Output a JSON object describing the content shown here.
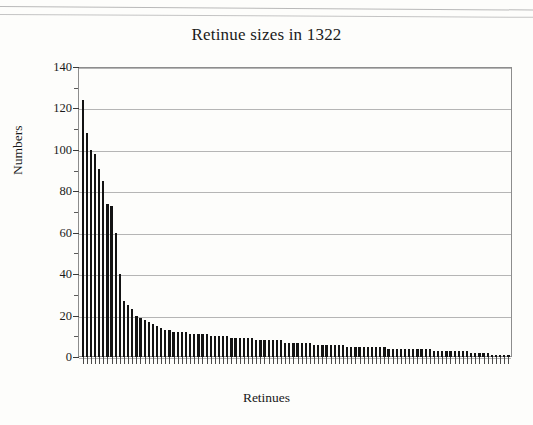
{
  "document": {
    "kind": "scanned-page-figure",
    "artifacts": [
      "scan-rule-top",
      "scan-rule-second"
    ]
  },
  "chart_data": {
    "type": "bar",
    "title": "Retinue sizes in 1322",
    "xlabel": "Retinues",
    "ylabel": "Numbers",
    "ylim": [
      0,
      140
    ],
    "ytick_step": 20,
    "ytick_labels": [
      "0",
      "20",
      "40",
      "60",
      "80",
      "100",
      "120",
      "140"
    ],
    "ytick_values": [
      0,
      20,
      40,
      60,
      80,
      100,
      120,
      140
    ],
    "yminor_step": 10,
    "grid": true,
    "legend": false,
    "xtick_labels": [],
    "bar_color": "#131313",
    "n_bars": 104,
    "categories": [
      "1",
      "2",
      "3",
      "4",
      "5",
      "6",
      "7",
      "8",
      "9",
      "10",
      "11",
      "12",
      "13",
      "14",
      "15",
      "16",
      "17",
      "18",
      "19",
      "20",
      "21",
      "22",
      "23",
      "24",
      "25",
      "26",
      "27",
      "28",
      "29",
      "30",
      "31",
      "32",
      "33",
      "34",
      "35",
      "36",
      "37",
      "38",
      "39",
      "40",
      "41",
      "42",
      "43",
      "44",
      "45",
      "46",
      "47",
      "48",
      "49",
      "50",
      "51",
      "52",
      "53",
      "54",
      "55",
      "56",
      "57",
      "58",
      "59",
      "60",
      "61",
      "62",
      "63",
      "64",
      "65",
      "66",
      "67",
      "68",
      "69",
      "70",
      "71",
      "72",
      "73",
      "74",
      "75",
      "76",
      "77",
      "78",
      "79",
      "80",
      "81",
      "82",
      "83",
      "84",
      "85",
      "86",
      "87",
      "88",
      "89",
      "90",
      "91",
      "92",
      "93",
      "94",
      "95",
      "96",
      "97",
      "98",
      "99",
      "100",
      "101",
      "102",
      "103",
      "104"
    ],
    "values": [
      124,
      108,
      100,
      98,
      91,
      85,
      74,
      73,
      60,
      40,
      27,
      25,
      23,
      20,
      19,
      18,
      17,
      16,
      15,
      14,
      13,
      13,
      12,
      12,
      12,
      12,
      11,
      11,
      11,
      11,
      11,
      10,
      10,
      10,
      10,
      10,
      9,
      9,
      9,
      9,
      9,
      9,
      8,
      8,
      8,
      8,
      8,
      8,
      8,
      7,
      7,
      7,
      7,
      7,
      7,
      7,
      6,
      6,
      6,
      6,
      6,
      6,
      6,
      6,
      5,
      5,
      5,
      5,
      5,
      5,
      5,
      5,
      5,
      5,
      4,
      4,
      4,
      4,
      4,
      4,
      4,
      4,
      4,
      4,
      4,
      3,
      3,
      3,
      3,
      3,
      3,
      3,
      3,
      3,
      2,
      2,
      2,
      2,
      2,
      1,
      1,
      1,
      1,
      1
    ]
  }
}
